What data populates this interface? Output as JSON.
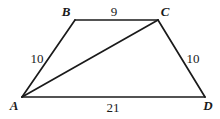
{
  "figure": {
    "type": "geometry-diagram",
    "shape": "trapezoid-with-diagonal",
    "background_color": "#ffffff",
    "stroke_color": "#1a1a1a",
    "text_color": "#1a1a1a",
    "vertices": [
      {
        "name": "A",
        "label": "A",
        "x": 22,
        "y": 97,
        "label_x": 14,
        "label_y": 105
      },
      {
        "name": "B",
        "label": "B",
        "x": 75,
        "y": 20,
        "label_x": 66,
        "label_y": 11
      },
      {
        "name": "C",
        "label": "C",
        "x": 158,
        "y": 20,
        "label_x": 165,
        "label_y": 11
      },
      {
        "name": "D",
        "label": "D",
        "x": 205,
        "y": 97,
        "label_x": 208,
        "label_y": 105
      }
    ],
    "edges": [
      {
        "name": "AB",
        "from": "A",
        "to": "B",
        "length_label": "10",
        "label_x": 37,
        "label_y": 58
      },
      {
        "name": "BC",
        "from": "B",
        "to": "C",
        "length_label": "9",
        "label_x": 114,
        "label_y": 11
      },
      {
        "name": "CD",
        "from": "C",
        "to": "D",
        "length_label": "10",
        "label_x": 193,
        "label_y": 58
      },
      {
        "name": "AD",
        "from": "A",
        "to": "D",
        "length_label": "21",
        "label_x": 113,
        "label_y": 107
      },
      {
        "name": "AC",
        "from": "A",
        "to": "C",
        "length_label": "",
        "label_x": 0,
        "label_y": 0
      }
    ],
    "side_labels": [
      {
        "name": "side-label-ab",
        "text": "10",
        "x": 37,
        "y": 58
      },
      {
        "name": "side-label-bc",
        "text": "9",
        "x": 114,
        "y": 11
      },
      {
        "name": "side-label-cd",
        "text": "10",
        "x": 193,
        "y": 58
      },
      {
        "name": "side-label-ad",
        "text": "21",
        "x": 113,
        "y": 107
      }
    ]
  }
}
